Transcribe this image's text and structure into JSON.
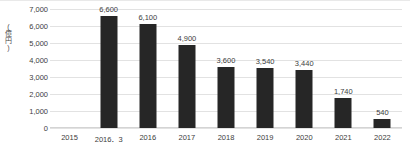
{
  "chart_data": {
    "type": "bar",
    "title": "",
    "subtitle": "",
    "xlabel": "",
    "ylabel": "(億円)",
    "categories": [
      "2015",
      "2016．3",
      "2016",
      "2017",
      "2018",
      "2019",
      "2020",
      "2021",
      "2022"
    ],
    "values": [
      0,
      6600,
      6100,
      4900,
      3600,
      3540,
      3440,
      1740,
      540
    ],
    "value_labels": [
      "",
      "6,600",
      "6,100",
      "4,900",
      "3,600",
      "3,540",
      "3,440",
      "1,740",
      "540"
    ],
    "ylim": [
      0,
      7000
    ],
    "ytick_values": [
      0,
      1000,
      2000,
      3000,
      4000,
      5000,
      6000,
      7000
    ],
    "ytick_labels": [
      "0",
      "1,000",
      "2,000",
      "3,000",
      "4,000",
      "5,000",
      "6,000",
      "7,000"
    ],
    "grid": true,
    "legend": false,
    "legend_position": "none",
    "bar_color": "#262626",
    "gridline_color": "#e2e2e2",
    "text_color": "#3d3d3d"
  }
}
